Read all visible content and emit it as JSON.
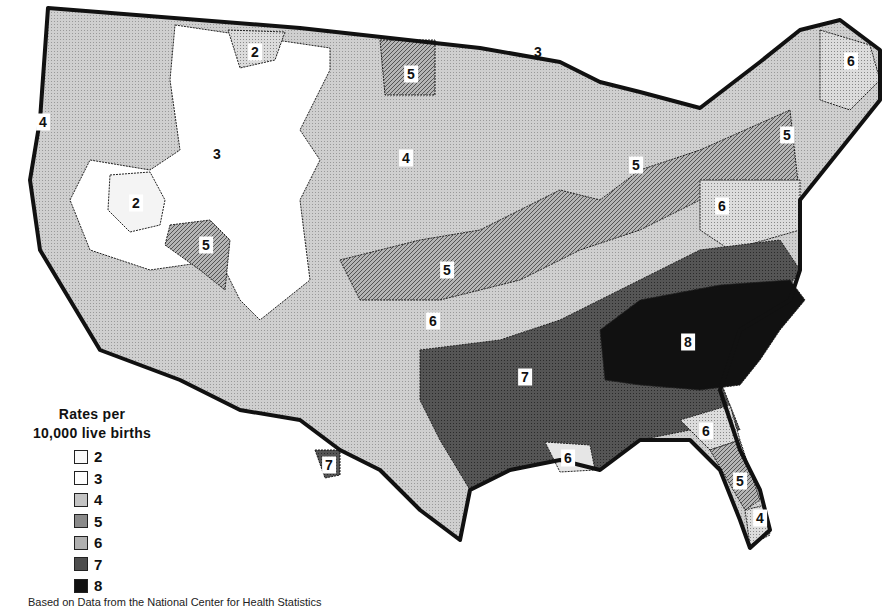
{
  "legend": {
    "title_line1": "Rates per",
    "title_line2": "10,000 live births",
    "items": [
      {
        "value": "2",
        "color": "#fafafa"
      },
      {
        "value": "3",
        "color": "#ffffff"
      },
      {
        "value": "4",
        "color": "#c4c4c4"
      },
      {
        "value": "5",
        "color": "#8a8a8a"
      },
      {
        "value": "6",
        "color": "#b0b0b0"
      },
      {
        "value": "7",
        "color": "#4e4e4e"
      },
      {
        "value": "8",
        "color": "#111111"
      }
    ]
  },
  "regions": [
    {
      "id": "pacific-northwest",
      "label": "4",
      "x": 43,
      "y": 122
    },
    {
      "id": "montana-north",
      "label": "2",
      "x": 255,
      "y": 52
    },
    {
      "id": "idaho-wyoming",
      "label": "3",
      "x": 217,
      "y": 154,
      "plain": true
    },
    {
      "id": "nevada-north",
      "label": "2",
      "x": 136,
      "y": 203
    },
    {
      "id": "utah-south",
      "label": "5",
      "x": 206,
      "y": 245
    },
    {
      "id": "north-dakota",
      "label": "5",
      "x": 411,
      "y": 74
    },
    {
      "id": "plains",
      "label": "4",
      "x": 406,
      "y": 158
    },
    {
      "id": "lake-superior",
      "label": "3",
      "x": 538,
      "y": 52,
      "plain": true
    },
    {
      "id": "michigan",
      "label": "5",
      "x": 636,
      "y": 165
    },
    {
      "id": "maine",
      "label": "6",
      "x": 851,
      "y": 61
    },
    {
      "id": "new-york",
      "label": "5",
      "x": 787,
      "y": 135
    },
    {
      "id": "pennsylvania",
      "label": "6",
      "x": 722,
      "y": 206
    },
    {
      "id": "kansas-missouri",
      "label": "5",
      "x": 447,
      "y": 270
    },
    {
      "id": "oklahoma",
      "label": "6",
      "x": 433,
      "y": 321
    },
    {
      "id": "deep-south",
      "label": "7",
      "x": 525,
      "y": 377
    },
    {
      "id": "carolinas-georgia",
      "label": "8",
      "x": 688,
      "y": 342
    },
    {
      "id": "texas-south",
      "label": "7",
      "x": 329,
      "y": 465
    },
    {
      "id": "louisiana-coast",
      "label": "6",
      "x": 568,
      "y": 458
    },
    {
      "id": "north-florida",
      "label": "6",
      "x": 706,
      "y": 431
    },
    {
      "id": "florida",
      "label": "5",
      "x": 740,
      "y": 481
    },
    {
      "id": "south-florida",
      "label": "4",
      "x": 760,
      "y": 518
    }
  ],
  "source": "Based on Data from the National Center for Health Statistics"
}
